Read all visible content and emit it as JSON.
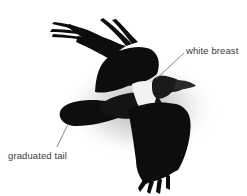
{
  "figure": {
    "background_color": "#ffffff",
    "bird_color": "#0d0d0d",
    "breast_color": "#f2f2f2",
    "shadow_color": "#b8b8b8"
  },
  "annotations": [
    {
      "id": "white-breast",
      "text": "white breast",
      "line": {
        "x1": 184,
        "y1": 53,
        "x2": 156,
        "y2": 79
      }
    },
    {
      "id": "graduated-tail",
      "text": "graduated tail",
      "line": {
        "x1": 57,
        "y1": 147,
        "x2": 68,
        "y2": 124
      }
    }
  ]
}
